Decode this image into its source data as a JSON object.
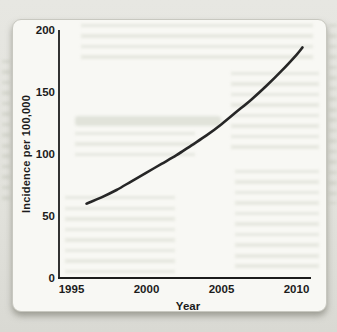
{
  "chart_data": {
    "type": "line",
    "title": "",
    "xlabel": "Year",
    "ylabel": "Incidence per 100,000",
    "x_ticks": [
      "1995",
      "2000",
      "2005",
      "2010"
    ],
    "y_ticks": [
      "0",
      "50",
      "100",
      "150",
      "200"
    ],
    "xlim": [
      1995,
      2010.8
    ],
    "ylim": [
      0,
      200
    ],
    "grid": false,
    "legend": "none",
    "line_color": "#262626",
    "series": [
      {
        "name": "Incidence per 100,000 by year",
        "x": [
          1996,
          1997,
          1998,
          1999,
          2000,
          2001,
          2002,
          2003,
          2004,
          2005,
          2006,
          2007,
          2008,
          2009,
          2010,
          2010.4
        ],
        "y": [
          60,
          65,
          71,
          78,
          85,
          92,
          99,
          107,
          115,
          124,
          134,
          144,
          155,
          167,
          180,
          186
        ]
      }
    ]
  },
  "colors": {
    "page_background": "#e3e3dd",
    "card_background": "#f8f8f4",
    "axis": "#1c1c1c",
    "curve": "#262626"
  }
}
